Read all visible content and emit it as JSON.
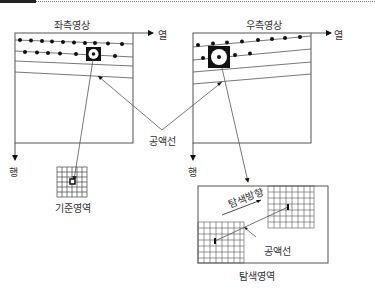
{
  "labels": {
    "left_image": "좌측영상",
    "right_image": "우측영상",
    "column_left": "열",
    "column_right": "열",
    "row_left": "행",
    "row_right": "행",
    "epipolar_line": "공액선",
    "reference_area": "기준영역",
    "search_direction": "탐색방향",
    "search_epipolar_line": "공액선",
    "search_area": "탐색영역"
  },
  "colors": {
    "line": "#555555",
    "dark": "#111111",
    "text": "#333333"
  }
}
